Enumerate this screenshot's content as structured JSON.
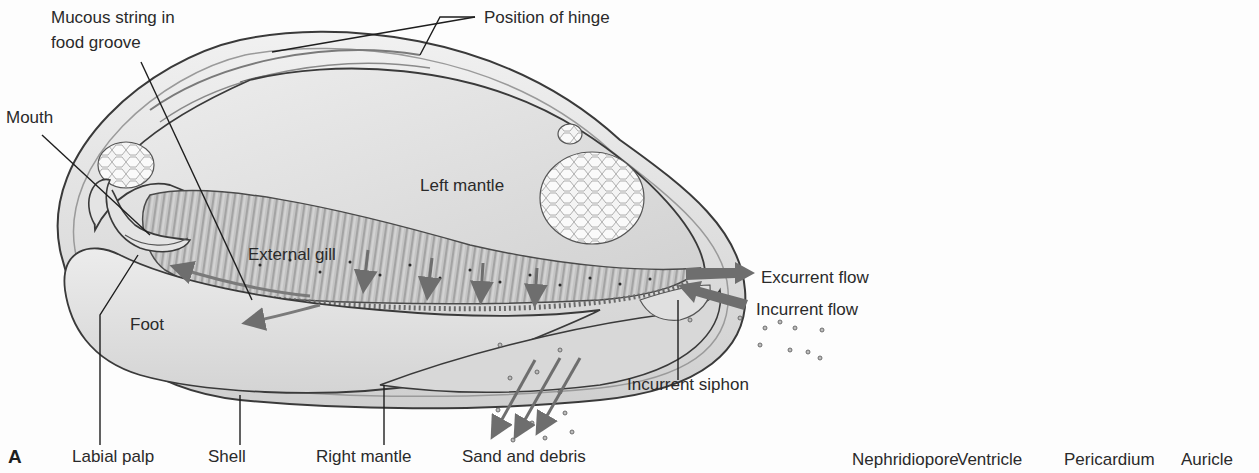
{
  "figure": {
    "panel_letter": "A",
    "colors": {
      "background": "#fdfdfd",
      "shell_fill": "#e6e6e6",
      "mantle_fill": "#dcdcdc",
      "gill_fill": "#b8b8b8",
      "foot_fill": "#e2e2e2",
      "outline": "#3a3a3a",
      "flow_arrow": "#6e6e6e",
      "leader_line": "#1e1e1e",
      "label_text": "#2a2a2a"
    }
  },
  "labels": {
    "mucous_string": [
      "Mucous string in",
      "food groove"
    ],
    "position_of_hinge": "Position of hinge",
    "mouth": "Mouth",
    "left_mantle": "Left mantle",
    "external_gill": "External gill",
    "foot": "Foot",
    "excurrent_flow": "Excurrent flow",
    "incurrent_flow": "Incurrent flow",
    "incurrent_siphon": "Incurrent siphon",
    "labial_palp": "Labial palp",
    "shell": "Shell",
    "right_mantle": "Right mantle",
    "sand_and_debris": "Sand and debris"
  },
  "panel_b_labels": {
    "nephridiopore": "Nephridiopore",
    "ventricle": "Ventricle",
    "pericardium": "Pericardium",
    "auricle": "Auricle"
  }
}
